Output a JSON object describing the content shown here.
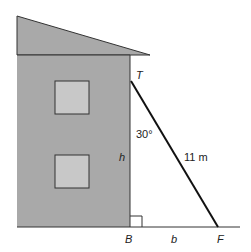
{
  "diagram": {
    "labels": {
      "top_point": "T",
      "base_point": "B",
      "foot_point": "F",
      "height": "h",
      "base": "b",
      "angle": "30°",
      "ladder_length": "11 m"
    },
    "colors": {
      "wall": "#a9a9a9",
      "window": "#c8c8c8",
      "line": "#111111"
    }
  }
}
